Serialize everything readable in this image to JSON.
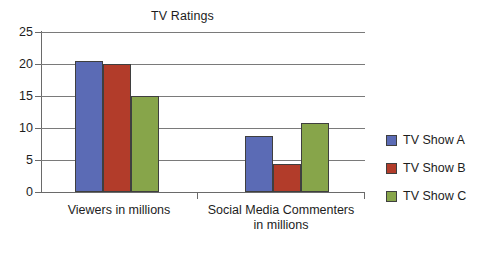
{
  "chart_data": {
    "type": "bar",
    "title": "TV Ratings",
    "xlabel": "",
    "ylabel": "",
    "ylim": [
      0,
      25
    ],
    "yticks": [
      0,
      5,
      10,
      15,
      20,
      25
    ],
    "grid": true,
    "legend_position": "right",
    "categories": [
      "Viewers in millions",
      "Social Media Commenters in millions"
    ],
    "series": [
      {
        "name": "TV Show A",
        "color": "#5b6bb5",
        "values": [
          20.4,
          8.7
        ]
      },
      {
        "name": "TV Show B",
        "color": "#b23c2a",
        "values": [
          20.0,
          4.3
        ]
      },
      {
        "name": "TV Show C",
        "color": "#87a54a",
        "values": [
          15.0,
          10.8
        ]
      }
    ]
  },
  "axis": {
    "y_tick_labels": [
      "25",
      "20",
      "15",
      "10",
      "5",
      "0"
    ]
  },
  "categories_display": [
    {
      "line1": "Viewers in millions",
      "line2": ""
    },
    {
      "line1": "Social Media Commenters",
      "line2": "in millions"
    }
  ],
  "legend": {
    "items": [
      {
        "label": "TV Show A",
        "color": "#5b6bb5"
      },
      {
        "label": "TV Show B",
        "color": "#b23c2a"
      },
      {
        "label": "TV Show C",
        "color": "#87a54a"
      }
    ]
  }
}
